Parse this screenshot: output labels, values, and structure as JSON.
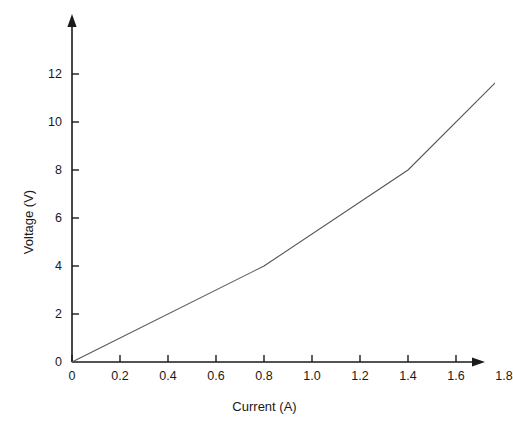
{
  "chart_data": {
    "type": "line",
    "title": "",
    "subtitle": "",
    "xlabel": "Current (A)",
    "ylabel": "Voltage (V)",
    "xlim": [
      0,
      1.9
    ],
    "ylim": [
      0,
      13
    ],
    "xticks": [
      0,
      0.2,
      0.4,
      0.6,
      0.8,
      1.0,
      1.2,
      1.4,
      1.6,
      1.8
    ],
    "xtick_labels": [
      "0",
      "0.2",
      "0.4",
      "0.6",
      "0.8",
      "1.0",
      "1.2",
      "1.4",
      "1.6",
      "1.8"
    ],
    "yticks": [
      0,
      2,
      4,
      6,
      8,
      10,
      12
    ],
    "ytick_labels": [
      "0",
      "2",
      "4",
      "6",
      "8",
      "10",
      "12"
    ],
    "grid": false,
    "legend": false,
    "legend_position": "none",
    "axis_arrows": true,
    "series": [
      {
        "name": "voltage-current-curve",
        "color": "#555555",
        "line_width": 1.1,
        "markers": false,
        "x": [
          0,
          0.8,
          1.4,
          1.8
        ],
        "y": [
          0,
          4,
          8,
          12
        ]
      }
    ]
  },
  "geometry": {
    "origin_x": 72,
    "origin_y": 362,
    "px_per_x_unit": 240,
    "px_per_y_unit": 24,
    "x_axis_end": 477,
    "y_axis_end": 22
  },
  "style": {
    "background": "#ffffff",
    "axis_color": "#1a1a1a",
    "line_color": "#555555",
    "text_color": "#1a1a1a"
  }
}
